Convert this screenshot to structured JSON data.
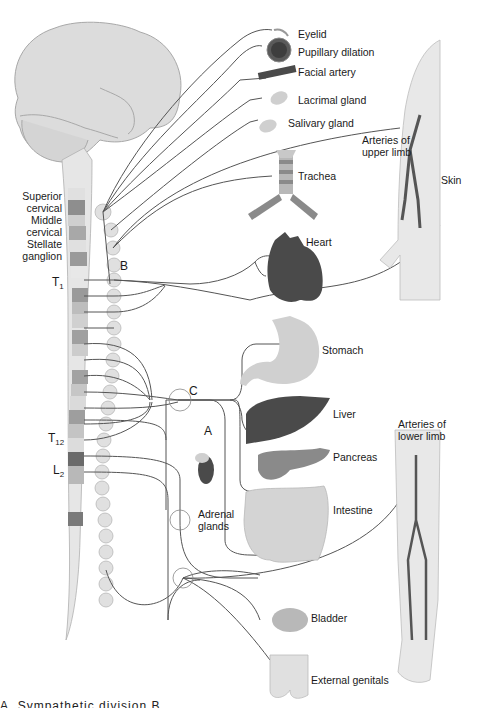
{
  "colors": {
    "background": "#ffffff",
    "organ_light": "#d6d6d6",
    "organ_mid": "#8c8c8c",
    "organ_dark": "#4a4a4a",
    "nerve_line": "#555555",
    "text": "#1a1a1a"
  },
  "ganglia_labels": {
    "superior_cervical": [
      "Superior",
      "cervical"
    ],
    "middle_cervical": [
      "Middle",
      "cervical"
    ],
    "stellate": [
      "Stellate",
      "ganglion"
    ]
  },
  "spinal_levels": {
    "t1": {
      "letter": "T",
      "sub": "1"
    },
    "t12": {
      "letter": "T",
      "sub": "12"
    },
    "l2": {
      "letter": "L",
      "sub": "2"
    }
  },
  "markers": {
    "a": "A",
    "b": "B",
    "c": "C"
  },
  "organs": [
    {
      "id": "eyelid",
      "label": "Eyelid"
    },
    {
      "id": "pupil",
      "label": "Pupillary dilation"
    },
    {
      "id": "facial_artery",
      "label": "Facial artery"
    },
    {
      "id": "lacrimal",
      "label": "Lacrimal gland"
    },
    {
      "id": "salivary",
      "label": "Salivary gland"
    },
    {
      "id": "upper_limb",
      "label": "Arteries of upper limb",
      "lines": [
        "Arteries of",
        "upper limb"
      ]
    },
    {
      "id": "skin",
      "label": "Skin"
    },
    {
      "id": "trachea",
      "label": "Trachea"
    },
    {
      "id": "heart",
      "label": "Heart"
    },
    {
      "id": "stomach",
      "label": "Stomach"
    },
    {
      "id": "liver",
      "label": "Liver"
    },
    {
      "id": "pancreas",
      "label": "Pancreas"
    },
    {
      "id": "adrenal",
      "label": "Adrenal glands",
      "lines": [
        "Adrenal",
        "glands"
      ]
    },
    {
      "id": "intestine",
      "label": "Intestine"
    },
    {
      "id": "lower_limb",
      "label": "Arteries of lower limb",
      "lines": [
        "Arteries of",
        "lower limb"
      ]
    },
    {
      "id": "bladder",
      "label": "Bladder"
    },
    {
      "id": "genitals",
      "label": "External genitals"
    }
  ],
  "caption_partial": "A.  Sympathetic division   B.  ..."
}
